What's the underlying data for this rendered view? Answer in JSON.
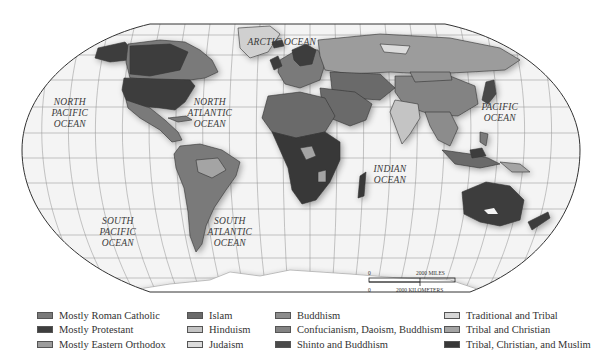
{
  "map": {
    "projection": "Robinson-like world projection",
    "background_color": "#f4f4f4",
    "graticule_color": "#8a8a8a",
    "outline_color": "#333333",
    "ocean_labels": [
      {
        "id": "arctic",
        "text": "ARCTIC OCEAN",
        "x": 282,
        "y": 37
      },
      {
        "id": "north-pacific",
        "text": "NORTH\nPACIFIC\nOCEAN",
        "x": 70,
        "y": 97
      },
      {
        "id": "north-atlantic",
        "text": "NORTH\nATLANTIC\nOCEAN",
        "x": 210,
        "y": 97
      },
      {
        "id": "pacific",
        "text": "PACIFIC\nOCEAN",
        "x": 500,
        "y": 102
      },
      {
        "id": "indian",
        "text": "INDIAN\nOCEAN",
        "x": 390,
        "y": 164
      },
      {
        "id": "south-pacific",
        "text": "SOUTH\nPACIFIC\nOCEAN",
        "x": 118,
        "y": 216
      },
      {
        "id": "south-atlantic",
        "text": "SOUTH\nATLANTIC\nOCEAN",
        "x": 230,
        "y": 216
      }
    ]
  },
  "scale_bar": {
    "top_zero": "0",
    "miles_label": "2000 MILES",
    "bottom_zero": "0",
    "km_label": "2000 KILOMETERS"
  },
  "legend": {
    "columns": [
      [
        {
          "label": "Mostly Roman Catholic",
          "color": "#7a7a7a"
        },
        {
          "label": "Mostly Protestant",
          "color": "#3e3e3e"
        },
        {
          "label": "Mostly Eastern Orthodox",
          "color": "#9c9c9c"
        }
      ],
      [
        {
          "label": "Islam",
          "color": "#6a6a6a"
        },
        {
          "label": "Hinduism",
          "color": "#c4c4c4"
        },
        {
          "label": "Judaism",
          "color": "#dcdcdc"
        }
      ],
      [
        {
          "label": "Buddhism",
          "color": "#8c8c8c"
        },
        {
          "label": "Confucianism, Daoism, Buddhism",
          "color": "#838383"
        },
        {
          "label": "Shinto and Buddhism",
          "color": "#4a4a4a"
        }
      ],
      [
        {
          "label": "Traditional and Tribal",
          "color": "#d6d6d6"
        },
        {
          "label": "Tribal and Christian",
          "color": "#a4a4a4"
        },
        {
          "label": "Tribal, Christian, and Muslim",
          "color": "#383838"
        }
      ]
    ]
  }
}
